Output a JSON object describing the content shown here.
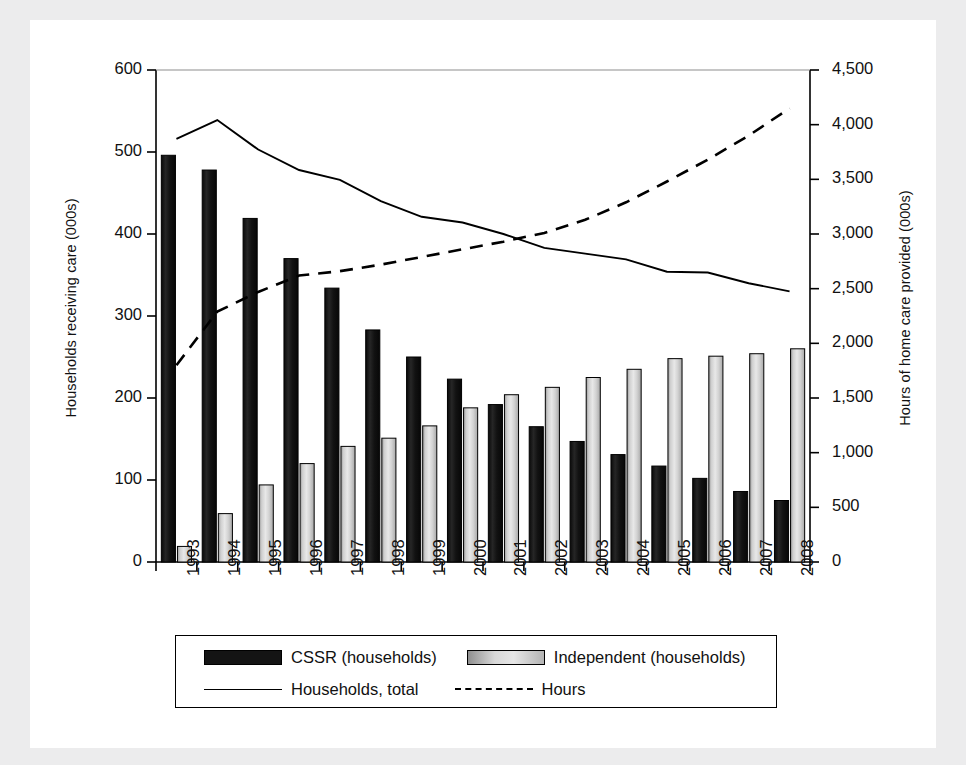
{
  "chart_data": {
    "type": "bar",
    "title": "",
    "xlabel": "",
    "ylabel": "Households receiving care (000s)",
    "ylabel_right": "Hours of home care provided (000s)",
    "categories": [
      "1993",
      "1994",
      "1995",
      "1996",
      "1997",
      "1998",
      "1999",
      "2000",
      "2001",
      "2002",
      "2003",
      "2004",
      "2005",
      "2006",
      "2007",
      "2008"
    ],
    "ylim": [
      0,
      600
    ],
    "ylim_right": [
      0,
      4500
    ],
    "yticks": [
      "0",
      "100",
      "200",
      "300",
      "400",
      "500",
      "600"
    ],
    "yticks_right": [
      "0",
      "500",
      "1,000",
      "1,500",
      "2,000",
      "2,500",
      "3,000",
      "3,500",
      "4,000",
      "4,500"
    ],
    "grid": false,
    "legend_position": "bottom",
    "series": [
      {
        "name": "CSSR (households)",
        "type": "bar",
        "axis": "left",
        "color": "#141414",
        "values": [
          496,
          478,
          419,
          370,
          334,
          283,
          250,
          223,
          192,
          165,
          147,
          131,
          117,
          102,
          86,
          75
        ]
      },
      {
        "name": "Independent (households)",
        "type": "bar",
        "axis": "left",
        "color": "#d2d2d2",
        "values": [
          19,
          59,
          94,
          120,
          141,
          151,
          166,
          188,
          204,
          213,
          225,
          235,
          248,
          251,
          254,
          260
        ]
      },
      {
        "name": "Households, total",
        "type": "line",
        "style": "solid",
        "axis": "left",
        "color": "#000000",
        "values": [
          516,
          539,
          503,
          478,
          466,
          440,
          421,
          414,
          400,
          383,
          376,
          369,
          354,
          353,
          340,
          330
        ]
      },
      {
        "name": "Hours",
        "type": "line",
        "style": "dashed",
        "axis": "right",
        "color": "#000000",
        "values": [
          1800,
          2290,
          2470,
          2620,
          2660,
          2720,
          2790,
          2860,
          2930,
          3010,
          3130,
          3290,
          3480,
          3680,
          3900,
          4150
        ]
      }
    ]
  },
  "legend": {
    "items": [
      {
        "label": "CSSR (households)",
        "marker": "dark-bar-swatch"
      },
      {
        "label": "Independent (households)",
        "marker": "light-bar-swatch"
      },
      {
        "label": "Households, total",
        "marker": "solid-line-swatch"
      },
      {
        "label": "Hours",
        "marker": "dashed-line-swatch"
      }
    ]
  }
}
